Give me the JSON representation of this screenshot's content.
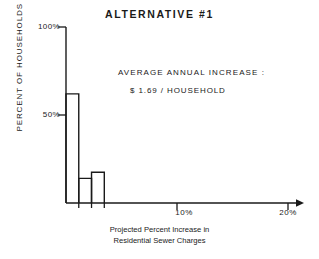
{
  "chart_data": {
    "type": "bar",
    "title": "ALTERNATIVE #1",
    "xlabel": "Projected Percent Increase in Residential Sewer Charges",
    "xlabel_lines": [
      "Projected Percent Increase in",
      "Residential Sewer Charges"
    ],
    "ylabel": "PERCENT OF HOUSEHOLDS",
    "ylabel_sub": "in 350 cities",
    "grid": false,
    "legend": "none",
    "xlim": [
      0,
      20
    ],
    "ylim": [
      0,
      100
    ],
    "xticks": [
      10,
      20
    ],
    "xtick_labels": [
      "10%",
      "20%"
    ],
    "yticks": [
      50,
      100
    ],
    "ytick_labels": [
      "50%",
      "100%"
    ],
    "bin_edges": [
      0,
      1.15,
      2.3,
      3.45
    ],
    "categories": [
      "0-1.15%",
      "1.15-2.3%",
      "2.3-3.45%"
    ],
    "values": [
      62,
      14,
      17.5
    ],
    "annotations": [
      "AVERAGE  ANNUAL  INCREASE :",
      "$ 1.69 / HOUSEHOLD"
    ],
    "series": [
      {
        "name": "Percent of households in 350 cities",
        "values": [
          62,
          14,
          17.5
        ]
      }
    ]
  },
  "annotation": {
    "line1": "AVERAGE  ANNUAL  INCREASE :",
    "line2": "$ 1.69 / HOUSEHOLD"
  },
  "axes": {
    "y_label_main": "PERCENT OF HOUSEHOLDS",
    "y_label_sub": "in 350 cities",
    "y_tick_100": "100%",
    "y_tick_50": "50%",
    "x_tick_10": "10%",
    "x_tick_20": "20%",
    "x_caption_line1": "Projected Percent Increase in",
    "x_caption_line2": "Residential Sewer Charges"
  },
  "header": {
    "title": "ALTERNATIVE #1"
  },
  "colors": {
    "ink": "#1a1a1a",
    "background": "#ffffff"
  }
}
